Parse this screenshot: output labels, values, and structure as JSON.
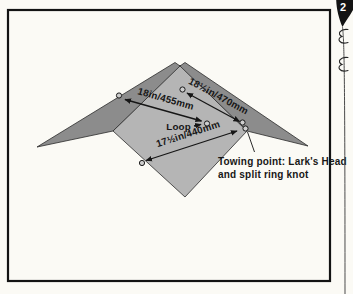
{
  "page_marker": {
    "number": "2"
  },
  "diagram": {
    "measurements": {
      "keel_edge": "18in/455mm",
      "leading_edge": "18½in/470mm",
      "trailing_edge": "17½in/440mm"
    },
    "loop_label": "Loop",
    "towing_note": {
      "line1": "Towing point: Lark's Head",
      "line2": "and split ring knot"
    },
    "colors": {
      "wing": "#8c8c8c",
      "sail": "#b5b5b5",
      "ink": "#131313"
    }
  }
}
